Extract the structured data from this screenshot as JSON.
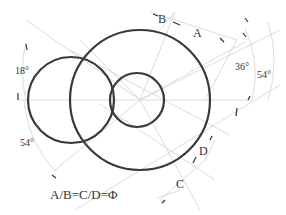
{
  "diagram": {
    "labels": {
      "a": "A",
      "b": "B",
      "c": "C",
      "d": "D",
      "angle_18": "18°",
      "angle_36": "36°",
      "angle_54_right": "54°",
      "angle_54_left": "54°",
      "formula": "A/B=C/D=Φ"
    },
    "circles": [
      {
        "name": "large-circle",
        "cx": 140,
        "cy": 100,
        "r": 70
      },
      {
        "name": "left-circle",
        "cx": 71,
        "cy": 100,
        "r": 43
      },
      {
        "name": "small-circle",
        "cx": 137,
        "cy": 100,
        "r": 27
      }
    ],
    "colors": {
      "circle_stroke": "#3a3a3a",
      "guide_stroke": "#cfcfcf",
      "text": "#333333"
    }
  }
}
